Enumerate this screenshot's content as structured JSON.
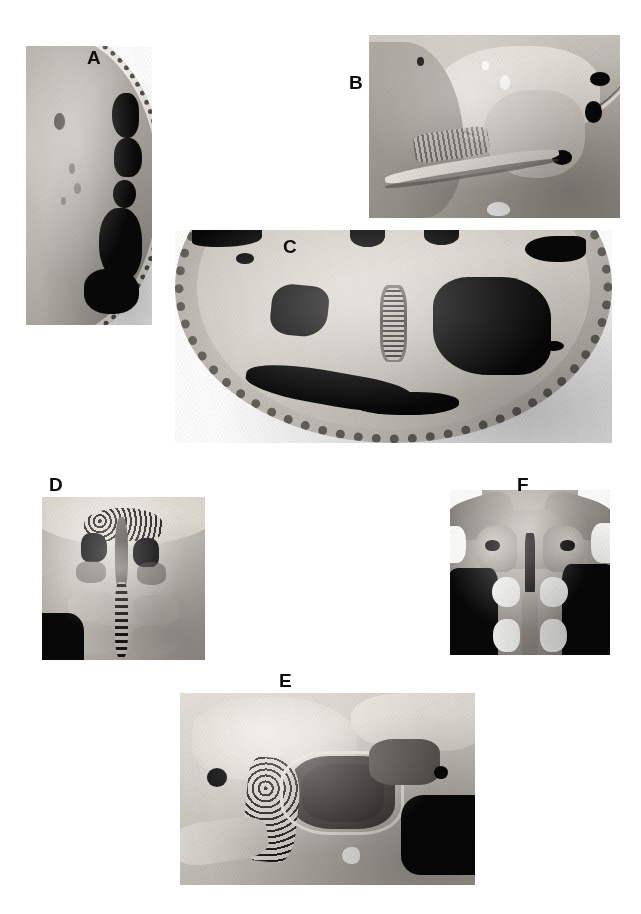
{
  "figure": {
    "type": "multi-panel-anatomical-photograph",
    "background_color": "#ffffff",
    "width": 641,
    "height": 914,
    "color_mode": "grayscale",
    "panel_count": 6
  },
  "panels": [
    {
      "id": "a",
      "label": "A",
      "label_x": 87,
      "label_y": 48,
      "x": 26,
      "y": 46,
      "width": 126,
      "height": 279,
      "description": "sagittal section of calvarium with dark air cells along the outer margin",
      "border_color": "#9b978f",
      "fill_color": "#bcb8b1",
      "air_cell_color": "#0a0a0a"
    },
    {
      "id": "b",
      "label": "B",
      "label_x": 349,
      "label_y": 73,
      "x": 369,
      "y": 35,
      "width": 251,
      "height": 183,
      "description": "sagittal section through the sphenoid region showing a large air-filled cavity",
      "border_color": "#9d9990",
      "fill_color": "#c3bfb7",
      "air_cell_color": "#0a0a0a"
    },
    {
      "id": "c",
      "label": "C",
      "label_x": 283,
      "label_y": 237,
      "x": 175,
      "y": 230,
      "width": 437,
      "height": 213,
      "description": "axial view of the skull base with bilateral dark sinus cavities and a central midline crest",
      "border_color": "#a6a29a",
      "fill_color": "#d2cec6",
      "air_cell_color": "#161513"
    },
    {
      "id": "d",
      "label": "D",
      "label_x": 49,
      "label_y": 475,
      "x": 42,
      "y": 497,
      "width": 163,
      "height": 163,
      "description": "anterior view of the ethmoid and nasal midline with perforated cribriform region",
      "border_color": "#a8a49c",
      "fill_color": "#d4d0c8",
      "air_cell_color": "#0a0a0a"
    },
    {
      "id": "e",
      "label": "E",
      "label_x": 279,
      "label_y": 671,
      "x": 180,
      "y": 693,
      "width": 295,
      "height": 192,
      "description": "sagittal section showing a large sphenoid sinus cavity bordered by trabecular bone",
      "border_color": "#a8a49c",
      "fill_color": "#d7d3cb",
      "air_cell_color": "#0b0b0b"
    },
    {
      "id": "f",
      "label": "F",
      "label_x": 517,
      "label_y": 475,
      "x": 450,
      "y": 490,
      "width": 160,
      "height": 165,
      "description": "coronal section through the nasal cavity and maxillary sinuses, symmetric about the midline",
      "border_color": "#6d6a64",
      "fill_color": "#b4b0a8",
      "air_cell_color": "#080808"
    }
  ]
}
